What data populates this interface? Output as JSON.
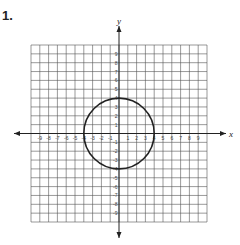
{
  "question": {
    "number": "1."
  },
  "chart_data": {
    "type": "scatter",
    "title": "",
    "xlabel": "x",
    "ylabel": "y",
    "xlim": [
      -10,
      10
    ],
    "ylim": [
      -10,
      10
    ],
    "grid": true,
    "x_ticks": [
      -9,
      -8,
      -7,
      -6,
      -5,
      -4,
      -3,
      -2,
      -1,
      1,
      2,
      3,
      4,
      5,
      6,
      7,
      8,
      9
    ],
    "y_ticks": [
      9,
      8,
      7,
      6,
      5,
      4,
      3,
      2,
      1,
      -1,
      -2,
      -3,
      -4,
      -5,
      -6,
      -7,
      -8,
      -9
    ],
    "shapes": [
      {
        "kind": "circle",
        "center": [
          0,
          0
        ],
        "radius": 4,
        "stroke": "#222222"
      }
    ]
  },
  "colors": {
    "grid": "#555555",
    "axis": "#222222",
    "curve": "#222222"
  }
}
